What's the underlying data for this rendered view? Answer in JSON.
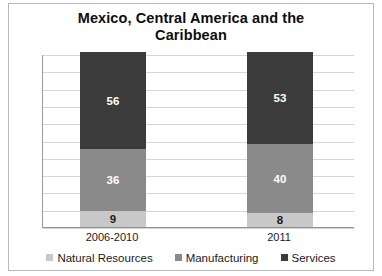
{
  "chart_data": {
    "type": "bar",
    "stacked": true,
    "title": "Mexico, Central America and the Caribbean",
    "title_lines": [
      "Mexico, Central America and the",
      "Caribbean"
    ],
    "xlabel": "",
    "ylabel": "Percentage",
    "ylim": [
      0,
      100
    ],
    "ytick_step": 10,
    "ytick_labels_visible": false,
    "grid": true,
    "legend_position": "bottom",
    "categories": [
      "2006-2010",
      "2011"
    ],
    "series": [
      {
        "name": "Natural Resources",
        "values": [
          9,
          8
        ],
        "color": "#c8c8c8"
      },
      {
        "name": "Manufacturing",
        "values": [
          36,
          40
        ],
        "color": "#8a8a8a"
      },
      {
        "name": "Services",
        "values": [
          56,
          53
        ],
        "color": "#3b3b3b"
      }
    ],
    "stack_order_bottom_to_top": [
      "Natural Resources",
      "Manufacturing",
      "Services"
    ],
    "data_labels": {
      "2006-2010": {
        "Natural Resources": "9",
        "Manufacturing": "36",
        "Services": "56"
      },
      "2011": {
        "Natural Resources": "8",
        "Manufacturing": "40",
        "Services": "53"
      }
    }
  },
  "legend": {
    "items": [
      {
        "label": "Natural Resources",
        "color": "#c8c8c8"
      },
      {
        "label": "Manufacturing",
        "color": "#8a8a8a"
      },
      {
        "label": "Services",
        "color": "#3b3b3b"
      }
    ]
  }
}
